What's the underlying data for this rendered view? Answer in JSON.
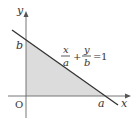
{
  "diagram": {
    "type": "coordinate-plane-intercept-form",
    "axes": {
      "x_label": "x",
      "y_label": "y",
      "origin_label": "O"
    },
    "intercepts": {
      "x_intercept_label": "a",
      "y_intercept_label": "b"
    },
    "equation": {
      "term1_num": "x",
      "term1_den": "a",
      "plus": "+",
      "term2_num": "y",
      "term2_den": "b",
      "equals": "=",
      "rhs": "1",
      "full_text": "x/a + y/b = 1"
    },
    "shaded_region": "triangle bounded by the line and both axes",
    "colors": {
      "axis": "#555555",
      "line": "#333333",
      "shade": "#dcdcdc",
      "text": "#333333"
    }
  }
}
